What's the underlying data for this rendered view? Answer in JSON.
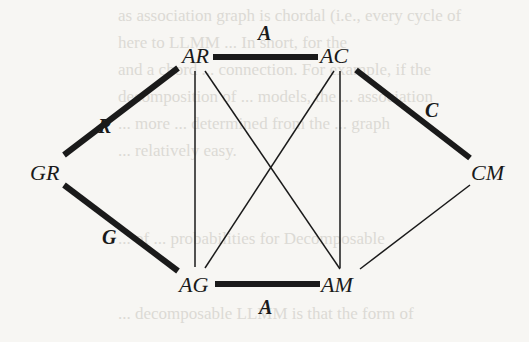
{
  "background_bleed_text": [
    "as association graph is chordal (i.e., every cycle of",
    "here to LLMM ... In short, for the",
    "and a chord ... connection. For example, if the",
    "decomposition of ... models, the ... association",
    "... more ... determined from the ... graph",
    "... relatively easy.",
    "... of ... probabilities for Decomposable",
    "... decomposable LLMM is that the form of"
  ],
  "diagram": {
    "nodes": [
      {
        "id": "AR",
        "label": "AR"
      },
      {
        "id": "AC",
        "label": "AC"
      },
      {
        "id": "GR",
        "label": "GR"
      },
      {
        "id": "CM",
        "label": "CM"
      },
      {
        "id": "AG",
        "label": "AG"
      },
      {
        "id": "AM",
        "label": "AM"
      }
    ],
    "thick_edges": [
      {
        "from": "AR",
        "to": "AC",
        "label": "A"
      },
      {
        "from": "GR",
        "to": "AR",
        "label": "R"
      },
      {
        "from": "GR",
        "to": "AG",
        "label": "G"
      },
      {
        "from": "AC",
        "to": "CM",
        "label": "C"
      },
      {
        "from": "AG",
        "to": "AM",
        "label": "A"
      }
    ],
    "thin_edges": [
      {
        "from": "AR",
        "to": "AG"
      },
      {
        "from": "AR",
        "to": "AM"
      },
      {
        "from": "AC",
        "to": "AG"
      },
      {
        "from": "AC",
        "to": "AM"
      },
      {
        "from": "CM",
        "to": "AM"
      }
    ]
  }
}
